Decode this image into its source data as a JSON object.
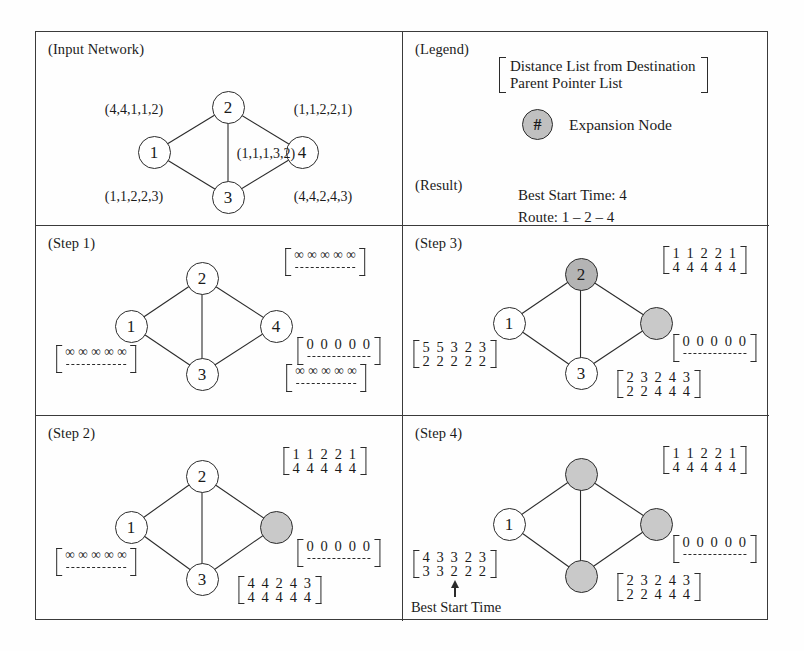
{
  "figure": {
    "panels": {
      "input_network": "(Input Network)",
      "legend": "(Legend)",
      "result": "(Result)",
      "step1": "(Step 1)",
      "step2": "(Step 2)",
      "step3": "(Step 3)",
      "step4": "(Step 4)"
    }
  },
  "legend": {
    "bracket_line1": "Distance List from Destination",
    "bracket_line2": "Parent Pointer List",
    "expansion_node_glyph": "#",
    "expansion_node_label": "Expansion Node"
  },
  "result": {
    "best_start_time": "Best Start Time: 4",
    "route": "Route: 1 – 2 – 4"
  },
  "input_network": {
    "nodes": [
      {
        "id": "1",
        "label": "1"
      },
      {
        "id": "2",
        "label": "2"
      },
      {
        "id": "3",
        "label": "3"
      },
      {
        "id": "4",
        "label": "4"
      }
    ],
    "edge_labels": {
      "e12": "(4,4,1,1,2)",
      "e24": "(1,1,2,2,1)",
      "e23": "(1,1,1,3,2)",
      "e13": "(1,1,2,2,3)",
      "e34": "(4,4,2,4,3)"
    }
  },
  "step1": {
    "nodes": [
      {
        "id": "1",
        "label": "1",
        "shaded": false
      },
      {
        "id": "2",
        "label": "2",
        "shaded": false
      },
      {
        "id": "3",
        "label": "3",
        "shaded": false
      },
      {
        "id": "4",
        "label": "4",
        "shaded": false
      }
    ],
    "lists": {
      "n1_top": "∞ ∞ ∞ ∞ ∞",
      "n1_bottom": "– – – – –",
      "n2_top": "∞ ∞ ∞ ∞ ∞",
      "n2_bottom": "– – – – –",
      "n3_top": "∞ ∞ ∞ ∞ ∞",
      "n3_bottom": "– – – – –",
      "n4_top": "0 0 0 0 0",
      "n4_bottom": "– – – – –"
    }
  },
  "step2": {
    "nodes": [
      {
        "id": "1",
        "label": "1",
        "shaded": false
      },
      {
        "id": "2",
        "label": "2",
        "shaded": false
      },
      {
        "id": "3",
        "label": "3",
        "shaded": false
      },
      {
        "id": "4",
        "label": "",
        "shaded": true
      }
    ],
    "lists": {
      "n1_top": "∞ ∞ ∞ ∞ ∞",
      "n1_bottom": "– – – – –",
      "n2_top": "1 1 2 2 1",
      "n2_bottom": "4 4 4 4 4",
      "n3_top": "4 4 2 4 3",
      "n3_bottom": "4 4 4 4 4",
      "n4_top": "0 0 0 0 0",
      "n4_bottom": "– – – – –"
    }
  },
  "step3": {
    "nodes": [
      {
        "id": "1",
        "label": "1",
        "shaded": false
      },
      {
        "id": "2",
        "label": "2",
        "shaded": true
      },
      {
        "id": "3",
        "label": "3",
        "shaded": false
      },
      {
        "id": "4",
        "label": "",
        "shaded": true
      }
    ],
    "lists": {
      "n1_top": "5 5 3 2 3",
      "n1_bottom": "2 2 2 2 2",
      "n2_top": "1 1 2 2 1",
      "n2_bottom": "4 4 4 4 4",
      "n3_top": "2 3 2 4 3",
      "n3_bottom": "2 2 4 4 4",
      "n4_top": "0 0 0 0 0",
      "n4_bottom": "– – – – –"
    }
  },
  "step4": {
    "nodes": [
      {
        "id": "1",
        "label": "1",
        "shaded": false
      },
      {
        "id": "2",
        "label": "",
        "shaded": true
      },
      {
        "id": "3",
        "label": "",
        "shaded": true
      },
      {
        "id": "4",
        "label": "",
        "shaded": true
      }
    ],
    "lists": {
      "n1_top": "4 3 3 2 3",
      "n1_bottom": "3 3 2 2 2",
      "n2_top": "1 1 2 2 1",
      "n2_bottom": "4 4 4 4 4",
      "n3_top": "2 3 2 4 3",
      "n3_bottom": "2 2 4 4 4",
      "n4_top": "0 0 0 0 0",
      "n4_bottom": "– – – – –"
    },
    "annotation": "Best Start Time"
  },
  "colors": {
    "ink": "#2b2b2b",
    "shaded_node": "#c9c9c9",
    "shaded_node_dark": "#b4b4b4",
    "background": "#ffffff"
  }
}
